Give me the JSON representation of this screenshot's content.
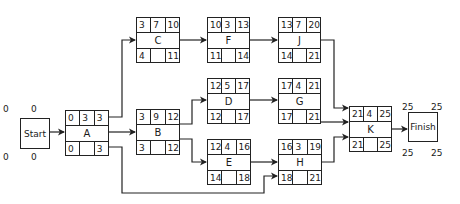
{
  "diagram": {
    "type": "activity-on-node network (critical path)",
    "start": {
      "label": "Start",
      "es": "0",
      "ef": "0",
      "ls": "0",
      "lf": "0"
    },
    "finish": {
      "label": "Finish",
      "es": "25",
      "ef": "25",
      "ls": "25",
      "lf": "25"
    },
    "nodes": {
      "A": {
        "name": "A",
        "es": "0",
        "dur": "3",
        "ef": "3",
        "ls": "0",
        "lf": "3"
      },
      "B": {
        "name": "B",
        "es": "3",
        "dur": "9",
        "ef": "12",
        "ls": "3",
        "lf": "12"
      },
      "C": {
        "name": "C",
        "es": "3",
        "dur": "7",
        "ef": "10",
        "ls": "4",
        "lf": "11"
      },
      "D": {
        "name": "D",
        "es": "12",
        "dur": "5",
        "ef": "17",
        "ls": "12",
        "lf": "17"
      },
      "E": {
        "name": "E",
        "es": "12",
        "dur": "4",
        "ef": "16",
        "ls": "14",
        "lf": "18"
      },
      "F": {
        "name": "F",
        "es": "10",
        "dur": "3",
        "ef": "13",
        "ls": "11",
        "lf": "14"
      },
      "G": {
        "name": "G",
        "es": "17",
        "dur": "4",
        "ef": "21",
        "ls": "17",
        "lf": "21"
      },
      "H": {
        "name": "H",
        "es": "16",
        "dur": "3",
        "ef": "19",
        "ls": "18",
        "lf": "21"
      },
      "J": {
        "name": "J",
        "es": "13",
        "dur": "7",
        "ef": "20",
        "ls": "14",
        "lf": "21"
      },
      "K": {
        "name": "K",
        "es": "21",
        "dur": "4",
        "ef": "25",
        "ls": "21",
        "lf": "25"
      }
    },
    "edges": [
      [
        "Start",
        "A"
      ],
      [
        "A",
        "C"
      ],
      [
        "A",
        "B"
      ],
      [
        "A",
        "H"
      ],
      [
        "C",
        "F"
      ],
      [
        "F",
        "J"
      ],
      [
        "B",
        "D"
      ],
      [
        "B",
        "E"
      ],
      [
        "D",
        "G"
      ],
      [
        "E",
        "H"
      ],
      [
        "J",
        "K"
      ],
      [
        "G",
        "K"
      ],
      [
        "H",
        "K"
      ],
      [
        "K",
        "Finish"
      ]
    ]
  }
}
